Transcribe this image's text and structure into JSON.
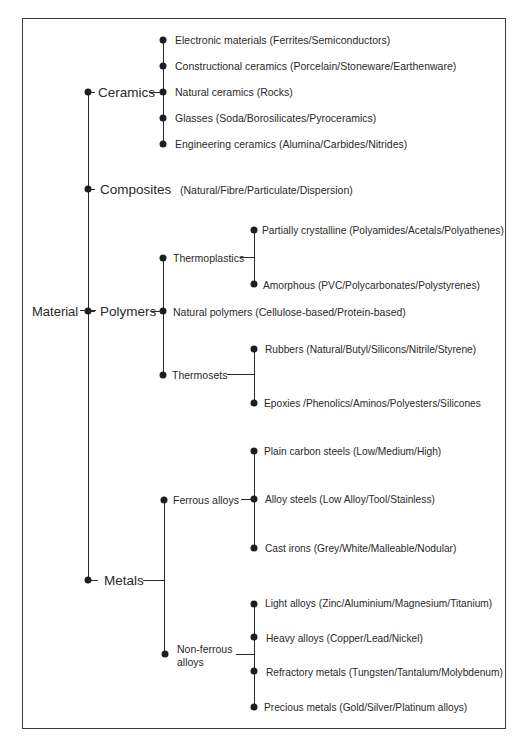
{
  "diagram": {
    "root": "Material",
    "categories": [
      {
        "label": "Ceramics",
        "children": [
          {
            "label": "Electronic materials (Ferrites/Semiconductors)"
          },
          {
            "label": "Constructional ceramics (Porcelain/Stoneware/Earthenware)"
          },
          {
            "label": "Natural ceramics (Rocks)"
          },
          {
            "label": "Glasses (Soda/Borosilicates/Pyroceramics)"
          },
          {
            "label": "Engineering ceramics (Alumina/Carbides/Nitrides)"
          }
        ]
      },
      {
        "label": "Composites",
        "detail": "(Natural/Fibre/Particulate/Dispersion)"
      },
      {
        "label": "Polymers",
        "children": [
          {
            "label": "Thermoplastics",
            "children": [
              {
                "label": "Partially crystalline (Polyamides/Acetals/Polyathenes)"
              },
              {
                "label": "Amorphous  (PVC/Polycarbonates/Polystyrenes)"
              }
            ]
          },
          {
            "label": "Natural polymers  (Cellulose-based/Protein-based)"
          },
          {
            "label": "Thermosets",
            "children": [
              {
                "label": "Rubbers  (Natural/Butyl/Silicons/Nitrile/Styrene)"
              },
              {
                "label": "Epoxies /Phenolics/Aminos/Polyesters/Silicones"
              }
            ]
          }
        ]
      },
      {
        "label": "Metals",
        "children": [
          {
            "label": "Ferrous alloys",
            "children": [
              {
                "label": "Plain carbon steels  (Low/Medium/High)"
              },
              {
                "label": "Alloy steels  (Low Alloy/Tool/Stainless)"
              },
              {
                "label": "Cast irons (Grey/White/Malleable/Nodular)"
              }
            ]
          },
          {
            "label_line1": "Non-ferrous",
            "label_line2": "alloys",
            "children": [
              {
                "label": "Light alloys (Zinc/Aluminium/Magnesium/Titanium)"
              },
              {
                "label": "Heavy alloys (Copper/Lead/Nickel)"
              },
              {
                "label": "Refractory metals (Tungsten/Tantalum/Molybdenum)"
              },
              {
                "label": "Precious metals (Gold/Silver/Platinum alloys)"
              }
            ]
          }
        ]
      }
    ]
  }
}
